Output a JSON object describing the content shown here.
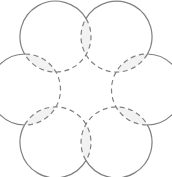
{
  "figure": {
    "title": "Six-circle rosette",
    "type": "geometric-diagram",
    "canvas": {
      "width": 172,
      "height": 177,
      "background_color": "#ffffff"
    },
    "geometry": {
      "center_x": 86,
      "center_y": 89.5,
      "hexagon_radius": 61,
      "circle_radius": 35.5,
      "circle_count": 6,
      "start_angle_deg": -120,
      "centers": [
        {
          "id": "circle-top-left",
          "x": 55.5,
          "y": 36.6,
          "angle_deg": -120
        },
        {
          "id": "circle-top-right",
          "x": 116.5,
          "y": 36.6,
          "angle_deg": -60
        },
        {
          "id": "circle-right",
          "x": 147.0,
          "y": 89.5,
          "angle_deg": 0
        },
        {
          "id": "circle-bottom-right",
          "x": 116.5,
          "y": 142.4,
          "angle_deg": 60
        },
        {
          "id": "circle-bottom-left",
          "x": 55.5,
          "y": 142.4,
          "angle_deg": 120
        },
        {
          "id": "circle-left",
          "x": 25.0,
          "y": 89.5,
          "angle_deg": 180
        }
      ],
      "petals": [
        {
          "id": "petal-top",
          "between": [
            "circle-top-left",
            "circle-top-right"
          ]
        },
        {
          "id": "petal-upper-right",
          "between": [
            "circle-top-right",
            "circle-right"
          ]
        },
        {
          "id": "petal-lower-right",
          "between": [
            "circle-right",
            "circle-bottom-right"
          ]
        },
        {
          "id": "petal-bottom",
          "between": [
            "circle-bottom-right",
            "circle-bottom-left"
          ]
        },
        {
          "id": "petal-lower-left",
          "between": [
            "circle-bottom-left",
            "circle-left"
          ]
        },
        {
          "id": "petal-upper-left",
          "between": [
            "circle-left",
            "circle-top-left"
          ]
        }
      ]
    },
    "style": {
      "fill_color": "#f2f2f2",
      "stroke_color": "#808080",
      "stroke_width": 1.2,
      "solid_pattern": "none",
      "dash_pattern": "5,3.6"
    }
  }
}
